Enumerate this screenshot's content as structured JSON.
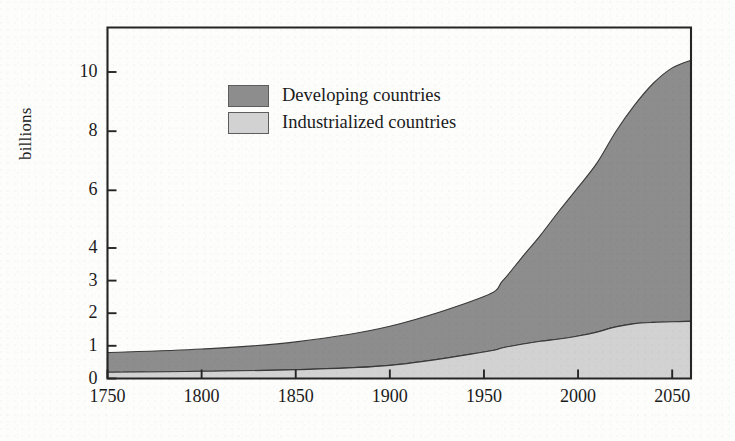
{
  "chart_data": {
    "type": "area",
    "title": "",
    "subtitle": "",
    "xlabel": "",
    "ylabel": "billions",
    "stacked": true,
    "grid": false,
    "legend_position": "inside-upper-left",
    "xlim": [
      1750,
      2060
    ],
    "ylim": [
      0,
      10.5
    ],
    "x_ticks": [
      1750,
      1800,
      1850,
      1900,
      1950,
      2000,
      2050
    ],
    "y_ticks": [
      0,
      1,
      2,
      3,
      4,
      6,
      8,
      10
    ],
    "y_axis_scale_note": "non-linear: unit steps 0-4 then 2-unit steps 4-10",
    "x": [
      1750,
      1800,
      1850,
      1900,
      1950,
      1960,
      1970,
      1980,
      1990,
      2000,
      2010,
      2020,
      2030,
      2040,
      2050,
      2060
    ],
    "series": [
      {
        "name": "Industrialized countries",
        "color": "#d2d2d2",
        "values": [
          0.19,
          0.22,
          0.27,
          0.4,
          0.81,
          0.94,
          1.05,
          1.14,
          1.21,
          1.3,
          1.42,
          1.58,
          1.68,
          1.72,
          1.74,
          1.75
        ]
      },
      {
        "name": "Developing countries",
        "color": "#8d8d8d",
        "values": [
          0.6,
          0.68,
          0.85,
          1.2,
          1.7,
          2.06,
          2.65,
          3.3,
          4.08,
          4.8,
          5.5,
          6.4,
          7.2,
          7.9,
          8.4,
          8.65
        ]
      }
    ],
    "totals": [
      0.79,
      0.9,
      1.12,
      1.6,
      2.51,
      3.0,
      3.7,
      4.44,
      5.29,
      6.1,
      6.92,
      7.98,
      8.88,
      9.62,
      10.14,
      10.4
    ],
    "annotations": []
  },
  "legend": {
    "items": [
      {
        "label": "Developing countries",
        "swatch_color": "#8d8d8d"
      },
      {
        "label": "Industrialized countries",
        "swatch_color": "#d2d2d2"
      }
    ]
  },
  "axes": {
    "y_label": "billions",
    "y_tick_labels": [
      "10",
      "8",
      "6",
      "4",
      "3",
      "2",
      "1",
      "0"
    ],
    "x_tick_labels": [
      "1750",
      "1800",
      "1850",
      "1900",
      "1950",
      "2000",
      "2050"
    ]
  },
  "style": {
    "axis_color": "#2a2a2a",
    "background": "#fdfdfb",
    "developing_fill": "#8d8d8d",
    "industrialized_fill": "#d2d2d2"
  }
}
